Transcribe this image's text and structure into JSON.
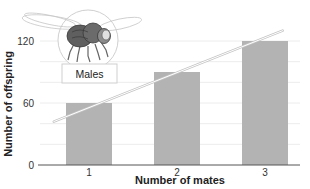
{
  "chart_data": {
    "type": "bar",
    "title": "",
    "categories": [
      "1",
      "2",
      "3"
    ],
    "values": [
      60,
      90,
      120
    ],
    "xlabel": "Number of mates",
    "ylabel": "Number of offspring",
    "ylim": [
      0,
      130
    ],
    "yticks": [
      0,
      60,
      120
    ],
    "grid": true,
    "gridline_interval": 20,
    "trendline": {
      "type": "linear",
      "start": {
        "x": 0.6,
        "y": 42
      },
      "end": {
        "x": 3.2,
        "y": 130
      }
    },
    "annotation": {
      "label": "Males",
      "image": "fruit-fly-illustration"
    },
    "colors": {
      "bar": "#b3b3b3",
      "trendline": "#ffffff",
      "trendline_outline": "#bdbdbd",
      "axis": "#555555",
      "grid": "#ececec"
    },
    "legend": null
  },
  "labels": {
    "xlabel": "Number of mates",
    "ylabel": "Number of offspring",
    "annotation": "Males",
    "xticks": [
      "1",
      "2",
      "3"
    ],
    "yticks": [
      "0",
      "60",
      "120"
    ]
  }
}
